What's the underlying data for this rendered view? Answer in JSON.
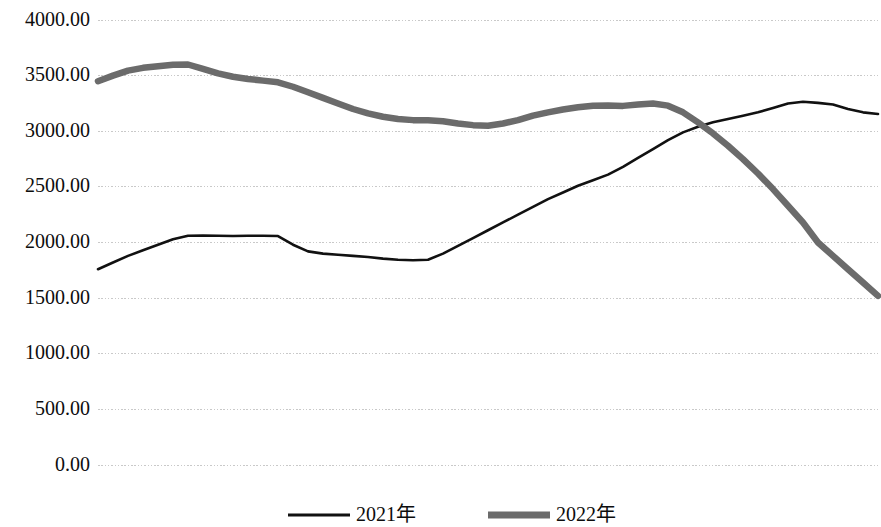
{
  "chart_data": {
    "type": "line",
    "title": "",
    "subtitle": "",
    "xlabel": "",
    "ylabel": "",
    "ylim": [
      0,
      4000
    ],
    "xlim": [
      0,
      52
    ],
    "grid": true,
    "grid_axis": "y",
    "legend_position": "bottom-center",
    "y_ticks": [
      0,
      500,
      1000,
      1500,
      2000,
      2500,
      3000,
      3500,
      4000
    ],
    "y_tick_labels": [
      "0.00",
      "500.00",
      "1000.00",
      "1500.00",
      "2000.00",
      "2500.00",
      "3000.00",
      "3500.00",
      "4000.00"
    ],
    "x_ticks": [],
    "x_tick_labels": [],
    "x": [
      0,
      1,
      2,
      3,
      4,
      5,
      6,
      7,
      8,
      9,
      10,
      11,
      12,
      13,
      14,
      15,
      16,
      17,
      18,
      19,
      20,
      21,
      22,
      23,
      24,
      25,
      26,
      27,
      28,
      29,
      30,
      31,
      32,
      33,
      34,
      35,
      36,
      37,
      38,
      39,
      40,
      41,
      42,
      43,
      44,
      45,
      46,
      47,
      48,
      49,
      50,
      51,
      52
    ],
    "series": [
      {
        "name": "2021年",
        "color": "#111111",
        "line_width": 2.6,
        "values": [
          1760,
          1820,
          1880,
          1930,
          1980,
          2030,
          2060,
          2062,
          2060,
          2058,
          2060,
          2060,
          2058,
          1980,
          1920,
          1900,
          1890,
          1880,
          1870,
          1855,
          1845,
          1840,
          1845,
          1900,
          1970,
          2040,
          2110,
          2180,
          2250,
          2320,
          2390,
          2450,
          2510,
          2560,
          2610,
          2680,
          2760,
          2840,
          2920,
          2990,
          3040,
          3080,
          3110,
          3140,
          3170,
          3210,
          3250,
          3265,
          3255,
          3240,
          3200,
          3170,
          3155
        ]
      },
      {
        "name": "2022年",
        "color": "#6b6b6b",
        "line_width": 6.5,
        "values": [
          3450,
          3500,
          3545,
          3570,
          3585,
          3598,
          3600,
          3560,
          3520,
          3490,
          3470,
          3455,
          3440,
          3400,
          3350,
          3300,
          3250,
          3200,
          3160,
          3130,
          3110,
          3100,
          3098,
          3090,
          3070,
          3055,
          3050,
          3070,
          3100,
          3140,
          3170,
          3195,
          3215,
          3230,
          3232,
          3228,
          3240,
          3250,
          3230,
          3170,
          3080,
          2980,
          2870,
          2750,
          2620,
          2480,
          2330,
          2180,
          2000,
          1880,
          1760,
          1640,
          1520
        ]
      }
    ]
  },
  "axis": {
    "y_labels": [
      "4000.00",
      "3500.00",
      "3000.00",
      "2500.00",
      "2000.00",
      "1500.00",
      "1000.00",
      "500.00",
      "0.00"
    ],
    "grid_color": "#c9c9c9"
  },
  "legend": {
    "items": [
      {
        "label": "2021年",
        "color": "#111111",
        "line_width": 2.8,
        "style": "solid-thin"
      },
      {
        "label": "2022年",
        "color": "#6b6b6b",
        "line_width": 7,
        "style": "solid-thick"
      }
    ]
  }
}
